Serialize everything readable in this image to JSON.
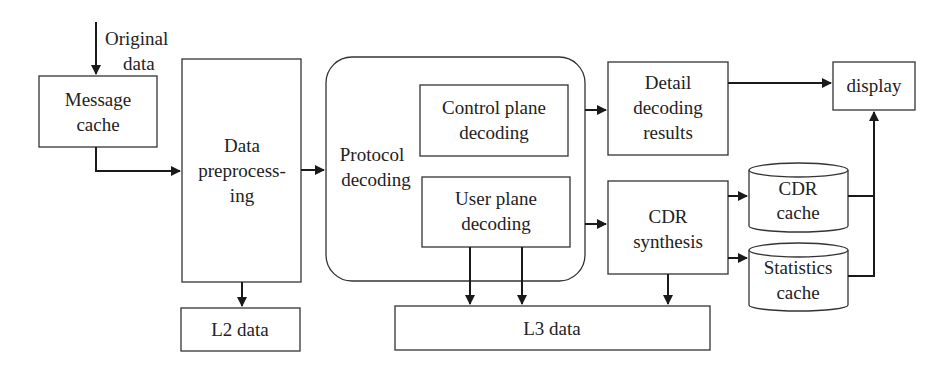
{
  "diagram": {
    "title": "",
    "colors": {
      "stroke": "#333333",
      "text": "#222222",
      "background": "#ffffff"
    },
    "input_label": {
      "line1": "Original",
      "line2": "data"
    },
    "nodes": {
      "message_cache": {
        "line1": "Message",
        "line2": "cache"
      },
      "data_preprocessing": {
        "line1": "Data",
        "line2": "preprocess-",
        "line3": "ing"
      },
      "protocol_decoding": {
        "line1": "Protocol",
        "line2": "decoding"
      },
      "control_plane_decoding": {
        "line1": "Control plane",
        "line2": "decoding"
      },
      "user_plane_decoding": {
        "line1": "User plane",
        "line2": "decoding"
      },
      "detail_decoding_results": {
        "line1": "Detail",
        "line2": "decoding",
        "line3": "results"
      },
      "cdr_synthesis": {
        "line1": "CDR",
        "line2": "synthesis"
      },
      "cdr_cache": {
        "line1": "CDR",
        "line2": "cache"
      },
      "statistics_cache": {
        "line1": "Statistics",
        "line2": "cache"
      },
      "display": {
        "line1": "display"
      },
      "l2_data": {
        "line1": "L2 data"
      },
      "l3_data": {
        "line1": "L3 data"
      }
    },
    "edges": [
      {
        "from": "Original data",
        "to": "Message cache"
      },
      {
        "from": "Message cache",
        "to": "Data preprocessing"
      },
      {
        "from": "Data preprocessing",
        "to": "Protocol decoding"
      },
      {
        "from": "Data preprocessing",
        "to": "L2 data"
      },
      {
        "from": "Control plane decoding",
        "to": "Detail decoding results"
      },
      {
        "from": "User plane decoding",
        "to": "CDR synthesis"
      },
      {
        "from": "User plane decoding",
        "to": "L3 data"
      },
      {
        "from": "User plane decoding",
        "to": "L3 data"
      },
      {
        "from": "Detail decoding results",
        "to": "display"
      },
      {
        "from": "CDR synthesis",
        "to": "CDR cache"
      },
      {
        "from": "CDR synthesis",
        "to": "Statistics cache"
      },
      {
        "from": "CDR synthesis",
        "to": "L3 data"
      },
      {
        "from": "CDR cache",
        "to": "display"
      },
      {
        "from": "Statistics cache",
        "to": "display"
      }
    ]
  }
}
